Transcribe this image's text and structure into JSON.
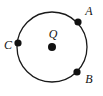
{
  "figure": {
    "type": "geometry-diagram",
    "width": 103,
    "height": 96,
    "background_color": "#ffffff",
    "stroke_color": "#1a1a1a",
    "dot_color": "#111111",
    "label_color": "#141414"
  },
  "circle": {
    "name": "circle-Q",
    "center_x": 52,
    "center_y": 47,
    "radius": 35,
    "stroke_width": 1.3
  },
  "center_point": {
    "label": "Q",
    "x": 52,
    "y": 47,
    "dot_radius": 4,
    "label_x": 53,
    "label_y": 34
  },
  "points": [
    {
      "label": "A",
      "x": 78,
      "y": 22,
      "dot_radius": 3.6,
      "label_x": 89,
      "label_y": 11,
      "angle_deg": 45
    },
    {
      "label": "B",
      "x": 77,
      "y": 72,
      "dot_radius": 3.6,
      "label_x": 89,
      "label_y": 79,
      "angle_deg": -45
    },
    {
      "label": "C",
      "x": 18,
      "y": 43,
      "dot_radius": 3.6,
      "label_x": 8,
      "label_y": 45,
      "angle_deg": 187
    }
  ]
}
